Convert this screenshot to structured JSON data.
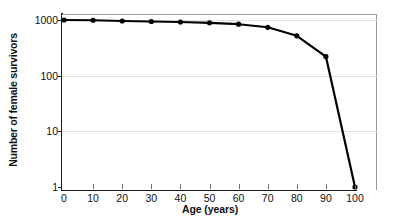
{
  "chart_data": {
    "type": "line",
    "title": "",
    "xlabel": "Age (years)",
    "ylabel": "Number of female survivors",
    "x": [
      0,
      10,
      20,
      30,
      40,
      50,
      60,
      70,
      80,
      90,
      100
    ],
    "values": [
      1000,
      990,
      960,
      940,
      920,
      890,
      840,
      740,
      520,
      220,
      1
    ],
    "series": [
      {
        "name": "Female survivors",
        "values": [
          1000,
          990,
          960,
          940,
          920,
          890,
          840,
          740,
          520,
          220,
          1
        ]
      }
    ],
    "xlim": [
      0,
      100
    ],
    "ylim": [
      1,
      1000
    ],
    "yscale": "log",
    "ytick_labels": [
      "1000",
      "100",
      "10",
      "1"
    ],
    "ytick_values": [
      1000,
      100,
      10,
      1
    ],
    "xtick_labels": [
      "0",
      "10",
      "20",
      "30",
      "40",
      "50",
      "60",
      "70",
      "80",
      "90",
      "100"
    ],
    "grid": true,
    "grid_axis": "y",
    "legend": false,
    "legend_position": "none",
    "marker": "filled-circle",
    "line_color": "#000000",
    "marker_color": "#000000",
    "grid_color": "#e2e2e2",
    "axis_color": "#1a1a1a",
    "background_color": "#ffffff"
  }
}
